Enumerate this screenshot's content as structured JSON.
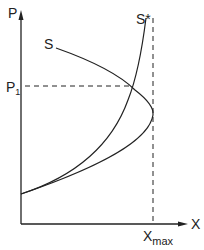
{
  "diagram": {
    "y_axis_label": "P",
    "x_axis_label": "X",
    "curve_s_label": "S",
    "curve_s_star_label": "S*",
    "p1_label_main": "P",
    "p1_label_sub": "1",
    "xmax_label_main": "X",
    "xmax_label_sub": "max",
    "line_color": "#222222"
  }
}
